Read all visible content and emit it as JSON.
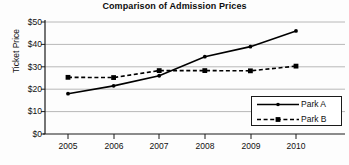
{
  "chart_data": {
    "type": "line",
    "title": "Comparison of Admission Prices",
    "xlabel": "",
    "ylabel": "Ticket Price",
    "categories": [
      "2005",
      "2006",
      "2007",
      "2008",
      "2009",
      "2010"
    ],
    "x": [
      2005,
      2006,
      2007,
      2008,
      2009,
      2010
    ],
    "series": [
      {
        "name": "Park A",
        "values": [
          18,
          21.5,
          26,
          34.5,
          39,
          46
        ],
        "line_style": "solid",
        "marker": "dot",
        "color": "#000000"
      },
      {
        "name": "Park B",
        "values": [
          25.3,
          25.2,
          28.3,
          28.3,
          28.2,
          30.3
        ],
        "line_style": "dashed",
        "marker": "square",
        "color": "#000000"
      }
    ],
    "ylim": [
      0,
      50
    ],
    "ytick_values": [
      0,
      10,
      20,
      30,
      40,
      50
    ],
    "ytick_labels": [
      "$0",
      "$10",
      "$20",
      "$30",
      "$40",
      "$50"
    ],
    "grid": true,
    "grid_axis": "y",
    "grid_color": "#b8b8b8",
    "legend_position": "bottom-right",
    "legend_entries": [
      "Park A",
      "Park B"
    ],
    "background": "#fdfdfd",
    "axis_color": "#1a1a1a"
  }
}
